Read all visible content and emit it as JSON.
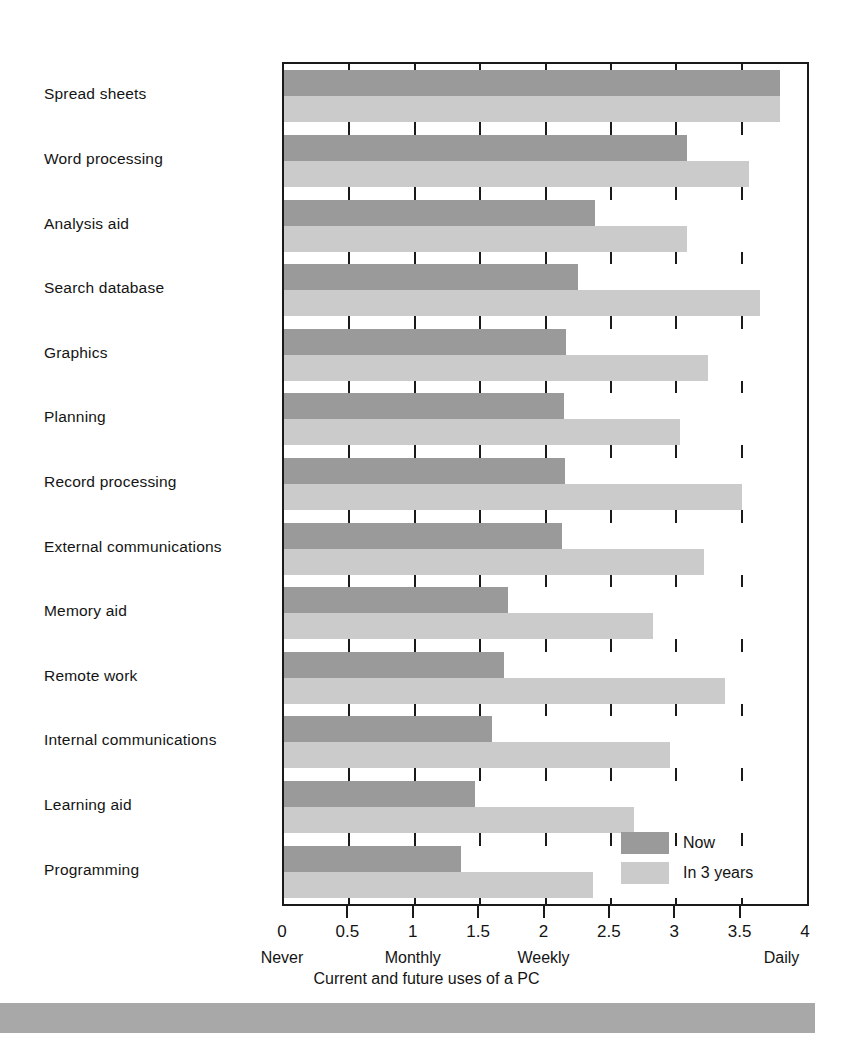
{
  "caption": "Current and future uses of a PC",
  "legend": {
    "position": "inside-bottom-right",
    "items": [
      {
        "label": "Now",
        "color": "#9a9a9a",
        "swatch_name": "legend-swatch-now"
      },
      {
        "label": "In 3 years",
        "color": "#cbcbcb",
        "swatch_name": "legend-swatch-in-3-years"
      }
    ]
  },
  "axis": {
    "tick_labels": [
      "0",
      "0.5",
      "1",
      "1.5",
      "2",
      "2.5",
      "3",
      "3.5",
      "4"
    ],
    "tick_values": [
      0,
      0.5,
      1,
      1.5,
      2,
      2.5,
      3,
      3.5,
      4
    ],
    "word_labels": [
      {
        "text": "Never",
        "value": 0
      },
      {
        "text": "Monthly",
        "value": 1
      },
      {
        "text": "Weekly",
        "value": 2
      },
      {
        "text": "Daily",
        "value": 3.82
      }
    ]
  },
  "chart_data": {
    "type": "bar",
    "orientation": "horizontal",
    "title": "Current and future uses of a PC",
    "xlabel": "Current and future uses of a PC",
    "ylabel": "",
    "xlim": [
      0,
      4
    ],
    "grid": true,
    "legend_position": "inside-bottom-right",
    "categories": [
      "Spread sheets",
      "Word processing",
      "Analysis aid",
      "Search database",
      "Graphics",
      "Planning",
      "Record processing",
      "External communications",
      "Memory aid",
      "Remote work",
      "Internal communications",
      "Learning aid",
      "Programming"
    ],
    "series": [
      {
        "name": "Now",
        "color": "#9a9a9a",
        "values": [
          3.79,
          3.08,
          2.38,
          2.25,
          2.16,
          2.14,
          2.15,
          2.13,
          1.71,
          1.68,
          1.59,
          1.46,
          1.35
        ]
      },
      {
        "name": "In 3 years",
        "color": "#cbcbcb",
        "values": [
          3.79,
          3.56,
          3.08,
          3.64,
          3.24,
          3.03,
          3.5,
          3.21,
          2.82,
          3.37,
          2.95,
          2.68,
          2.36
        ]
      }
    ],
    "scale_anchors": [
      {
        "value": 0,
        "meaning": "Never"
      },
      {
        "value": 1,
        "meaning": "Monthly"
      },
      {
        "value": 2,
        "meaning": "Weekly"
      },
      {
        "value": 4,
        "meaning": "Daily"
      }
    ]
  }
}
